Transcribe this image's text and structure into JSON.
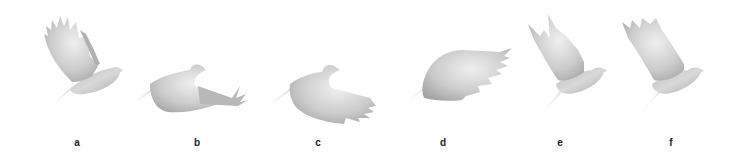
{
  "figure": {
    "colors": {
      "background": "#ffffff",
      "bird_light": "#f2f2f2",
      "bird_mid": "#c8c8c8",
      "bird_dark": "#a9a9a9",
      "label": "#222222"
    },
    "panels": [
      {
        "label": "a",
        "phase": "wings-up"
      },
      {
        "label": "b",
        "phase": "downstroke-begin"
      },
      {
        "label": "c",
        "phase": "downstroke"
      },
      {
        "label": "d",
        "phase": "wings-down"
      },
      {
        "label": "e",
        "phase": "upstroke"
      },
      {
        "label": "f",
        "phase": "wings-raised"
      }
    ]
  }
}
